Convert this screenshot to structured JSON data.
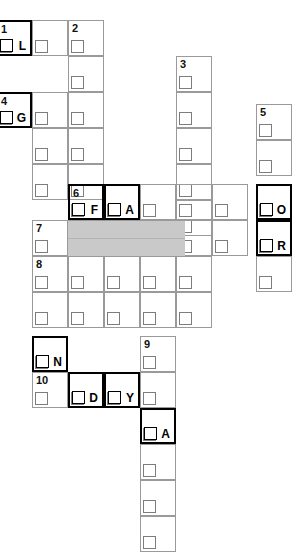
{
  "puzzle": {
    "title": "Crossword grid",
    "width": 306,
    "height": 555,
    "cell_size": 36,
    "colors": {
      "grid_line": "#9a9a9a",
      "bold_line": "#000000",
      "shaded_fill": "#c9c9c9",
      "background": "#ffffff",
      "text": "#000000"
    },
    "cells": [
      {
        "name": "cell-r1c0",
        "x": -4,
        "y": 20,
        "num": "1",
        "letter": "L",
        "bold": true,
        "shaded": false
      },
      {
        "name": "cell-r1c1",
        "x": 32,
        "y": 20,
        "num": "",
        "letter": "",
        "bold": false,
        "shaded": false
      },
      {
        "name": "cell-r1c2",
        "x": 68,
        "y": 20,
        "num": "2",
        "letter": "",
        "bold": false,
        "shaded": false
      },
      {
        "name": "cell-r2c2",
        "x": 68,
        "y": 56,
        "num": "",
        "letter": "",
        "bold": false,
        "shaded": false
      },
      {
        "name": "cell-r3c0",
        "x": -4,
        "y": 92,
        "num": "4",
        "letter": "G",
        "bold": true,
        "shaded": false
      },
      {
        "name": "cell-r3c1",
        "x": 32,
        "y": 92,
        "num": "",
        "letter": "",
        "bold": false,
        "shaded": false
      },
      {
        "name": "cell-r3c2",
        "x": 68,
        "y": 92,
        "num": "",
        "letter": "",
        "bold": false,
        "shaded": false
      },
      {
        "name": "cell-r3c4",
        "x": 176,
        "y": 56,
        "num": "3",
        "letter": "",
        "bold": false,
        "shaded": false
      },
      {
        "name": "cell-r4c4",
        "x": 176,
        "y": 92,
        "num": "",
        "letter": "",
        "bold": false,
        "shaded": false
      },
      {
        "name": "cell-r5c4",
        "x": 176,
        "y": 128,
        "num": "",
        "letter": "",
        "bold": false,
        "shaded": false
      },
      {
        "name": "cell-r6c4",
        "x": 176,
        "y": 164,
        "num": "",
        "letter": "",
        "bold": false,
        "shaded": false
      },
      {
        "name": "cell-r3c6",
        "x": 256,
        "y": 104,
        "num": "5",
        "letter": "",
        "bold": false,
        "shaded": false
      },
      {
        "name": "cell-r4c6",
        "x": 256,
        "y": 140,
        "num": "",
        "letter": "",
        "bold": false,
        "shaded": false
      },
      {
        "name": "cell-r5c6",
        "x": 256,
        "y": 184,
        "num": "",
        "letter": "O",
        "bold": true,
        "shaded": false
      },
      {
        "name": "cell-r6c6",
        "x": 256,
        "y": 220,
        "num": "",
        "letter": "R",
        "bold": true,
        "shaded": false
      },
      {
        "name": "cell-r7c6",
        "x": 256,
        "y": 256,
        "num": "",
        "letter": "",
        "bold": false,
        "shaded": false
      },
      {
        "name": "cell-r5c2-six",
        "x": 68,
        "y": 184,
        "num": "6",
        "letter": "F",
        "bold": true,
        "shaded": false
      },
      {
        "name": "cell-r5c3-a",
        "x": 104,
        "y": 184,
        "num": "",
        "letter": "A",
        "bold": true,
        "shaded": false
      },
      {
        "name": "cell-r5c1",
        "x": 32,
        "y": 164,
        "num": "",
        "letter": "",
        "bold": false,
        "shaded": false
      },
      {
        "name": "cell-r5c5",
        "x": 140,
        "y": 164,
        "num": "",
        "letter": "",
        "bold": false,
        "shaded": false
      },
      {
        "name": "cell-r5c5b",
        "x": 176,
        "y": 200,
        "num": "",
        "letter": "",
        "bold": false,
        "shaded": false
      },
      {
        "name": "cell-r6c0-seven",
        "x": 32,
        "y": 220,
        "num": "7",
        "letter": "",
        "bold": false,
        "shaded": false
      },
      {
        "name": "cell-r7c0-eight",
        "x": 32,
        "y": 256,
        "num": "8",
        "letter": "",
        "bold": false,
        "shaded": false
      },
      {
        "name": "cell-r8c1",
        "x": 68,
        "y": 256,
        "num": "",
        "letter": "",
        "bold": false,
        "shaded": false
      },
      {
        "name": "cell-r8c2",
        "x": 104,
        "y": 256,
        "num": "",
        "letter": "",
        "bold": false,
        "shaded": false
      },
      {
        "name": "cell-r8c3",
        "x": 140,
        "y": 256,
        "num": "",
        "letter": "",
        "bold": false,
        "shaded": false
      },
      {
        "name": "cell-r8c4",
        "x": 176,
        "y": 256,
        "num": "",
        "letter": "",
        "bold": false,
        "shaded": false
      },
      {
        "name": "cell-r9c1",
        "x": 32,
        "y": 292,
        "num": "",
        "letter": "",
        "bold": false,
        "shaded": false
      },
      {
        "name": "cell-r9c2",
        "x": 68,
        "y": 220,
        "num": "",
        "letter": "",
        "bold": false,
        "shaded": true
      },
      {
        "name": "cell-r9c3",
        "x": 104,
        "y": 220,
        "num": "",
        "letter": "",
        "bold": false,
        "shaded": true
      },
      {
        "name": "cell-r9c4",
        "x": 140,
        "y": 220,
        "num": "",
        "letter": "",
        "bold": false,
        "shaded": true
      },
      {
        "name": "cell-n",
        "x": 32,
        "y": 336,
        "num": "",
        "letter": "N",
        "bold": true,
        "shaded": false
      },
      {
        "name": "cell-10",
        "x": 32,
        "y": 372,
        "num": "10",
        "letter": "",
        "bold": false,
        "shaded": false
      },
      {
        "name": "cell-d",
        "x": 68,
        "y": 372,
        "num": "",
        "letter": "D",
        "bold": true,
        "shaded": false
      },
      {
        "name": "cell-y",
        "x": 104,
        "y": 372,
        "num": "",
        "letter": "Y",
        "bold": true,
        "shaded": false
      },
      {
        "name": "cell-9",
        "x": 140,
        "y": 336,
        "num": "9",
        "letter": "",
        "bold": false,
        "shaded": false
      },
      {
        "name": "cell-r10c3",
        "x": 140,
        "y": 372,
        "num": "",
        "letter": "",
        "bold": false,
        "shaded": false
      },
      {
        "name": "cell-a-bot",
        "x": 140,
        "y": 408,
        "num": "",
        "letter": "A",
        "bold": true,
        "shaded": false
      },
      {
        "name": "cell-r12c3",
        "x": 140,
        "y": 444,
        "num": "",
        "letter": "",
        "bold": false,
        "shaded": false
      },
      {
        "name": "cell-r13c3",
        "x": 140,
        "y": 480,
        "num": "",
        "letter": "",
        "bold": false,
        "shaded": false
      },
      {
        "name": "cell-r14c3",
        "x": 140,
        "y": 516,
        "num": "",
        "letter": "",
        "bold": false,
        "shaded": false
      }
    ],
    "long_rows": [
      {
        "name": "row-strip-top1",
        "x": -4,
        "y": 20,
        "w": 144,
        "h": 36
      },
      {
        "name": "row-strip-top2",
        "x": -4,
        "y": 92,
        "w": 252,
        "h": 36
      },
      {
        "name": "row-strip-mid6",
        "x": 32,
        "y": 184,
        "w": 260,
        "h": 36
      },
      {
        "name": "row-strip-seven",
        "x": 32,
        "y": 220,
        "w": 260,
        "h": 36
      },
      {
        "name": "row-strip-eight",
        "x": 32,
        "y": 256,
        "w": 180,
        "h": 36
      },
      {
        "name": "row-strip-nine",
        "x": 32,
        "y": 292,
        "w": 180,
        "h": 36
      },
      {
        "name": "row-strip-ten",
        "x": 32,
        "y": 372,
        "w": 144,
        "h": 36
      }
    ],
    "shaded_band": {
      "name": "shaded-band",
      "x": 68,
      "y": 221,
      "w": 117,
      "h": 35,
      "divider_y": 238
    },
    "columns": [
      {
        "name": "col-strip-2",
        "x": 68,
        "y": 20,
        "w": 36,
        "h": 272
      },
      {
        "name": "col-strip-3",
        "x": 176,
        "y": 56,
        "w": 36,
        "h": 236
      },
      {
        "name": "col-strip-5",
        "x": 256,
        "y": 104,
        "w": 36,
        "h": 188
      },
      {
        "name": "col-strip-9",
        "x": 140,
        "y": 336,
        "w": 36,
        "h": 216
      },
      {
        "name": "col-strip-1",
        "x": 32,
        "y": 20,
        "w": 36,
        "h": 308
      }
    ]
  }
}
